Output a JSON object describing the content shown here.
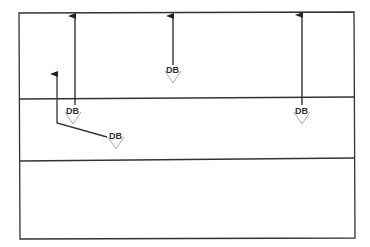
{
  "diagram": {
    "frame": {
      "x1": 19,
      "y1": 13,
      "x2": 354,
      "y2": 238
    },
    "lanes": [
      {
        "name": "lane-1",
        "y_top": 13,
        "y_bottom": 98
      },
      {
        "name": "lane-2",
        "y_top": 98,
        "y_bottom": 160
      },
      {
        "name": "lane-3",
        "y_top": 160,
        "y_bottom": 238
      }
    ],
    "line_color": "#333333",
    "marker_color": "#aaaaaa",
    "markers": [
      {
        "id": "db-1",
        "label": "DB",
        "x": 73,
        "y": 113
      },
      {
        "id": "db-2",
        "label": "DB",
        "x": 116,
        "y": 138
      },
      {
        "id": "db-3",
        "label": "DB",
        "x": 173,
        "y": 72
      },
      {
        "id": "db-4",
        "label": "DB",
        "x": 302,
        "y": 113
      }
    ],
    "arrows": [
      {
        "id": "arrow-1",
        "from": [
          75,
          107
        ],
        "to": [
          75,
          15
        ]
      },
      {
        "id": "arrow-2",
        "from": [
          173,
          65
        ],
        "to": [
          173,
          15
        ]
      },
      {
        "id": "arrow-3",
        "from": [
          302,
          107
        ],
        "to": [
          302,
          15
        ]
      },
      {
        "id": "arrow-4",
        "from": [
          57,
          125
        ],
        "to": [
          57,
          72
        ]
      }
    ]
  }
}
